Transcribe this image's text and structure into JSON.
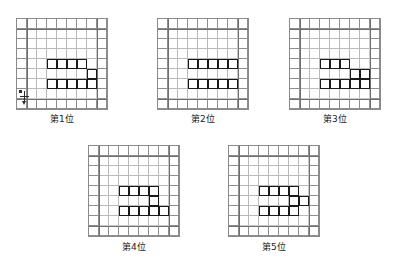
{
  "page": {
    "background": "#ffffff",
    "grid_line_color": "#b9b9b9",
    "grid_border_color": "#8a8a8a",
    "piece_color": "#1a1a1a",
    "caption_color": "#1a1a1a"
  },
  "grid": {
    "columns": 9,
    "rows": 9,
    "cell_px": 10
  },
  "figures": [
    {
      "id": "figure-1",
      "caption": "第1位",
      "piece_cells": [
        [
          4,
          3
        ],
        [
          4,
          4
        ],
        [
          4,
          5
        ],
        [
          4,
          6
        ],
        [
          5,
          7
        ],
        [
          6,
          3
        ],
        [
          6,
          4
        ],
        [
          6,
          5
        ],
        [
          6,
          6
        ],
        [
          6,
          7
        ]
      ],
      "has_marker": true
    },
    {
      "id": "figure-2",
      "caption": "第2位",
      "piece_cells": [
        [
          4,
          3
        ],
        [
          4,
          4
        ],
        [
          4,
          5
        ],
        [
          4,
          6
        ],
        [
          4,
          7
        ],
        [
          6,
          3
        ],
        [
          6,
          4
        ],
        [
          6,
          5
        ],
        [
          6,
          6
        ],
        [
          6,
          7
        ]
      ],
      "has_marker": false
    },
    {
      "id": "figure-3",
      "caption": "第3位",
      "piece_cells": [
        [
          4,
          3
        ],
        [
          4,
          4
        ],
        [
          4,
          5
        ],
        [
          5,
          6
        ],
        [
          5,
          7
        ],
        [
          6,
          3
        ],
        [
          6,
          4
        ],
        [
          6,
          5
        ],
        [
          6,
          6
        ],
        [
          6,
          7
        ]
      ],
      "has_marker": false
    },
    {
      "id": "figure-4",
      "caption": "第4位",
      "piece_cells": [
        [
          4,
          3
        ],
        [
          4,
          4
        ],
        [
          4,
          5
        ],
        [
          4,
          6
        ],
        [
          5,
          6
        ],
        [
          6,
          3
        ],
        [
          6,
          4
        ],
        [
          6,
          5
        ],
        [
          6,
          6
        ],
        [
          6,
          7
        ]
      ],
      "has_marker": false
    },
    {
      "id": "figure-5",
      "caption": "第5位",
      "piece_cells": [
        [
          4,
          3
        ],
        [
          4,
          4
        ],
        [
          4,
          5
        ],
        [
          4,
          6
        ],
        [
          5,
          6
        ],
        [
          5,
          7
        ],
        [
          6,
          3
        ],
        [
          6,
          4
        ],
        [
          6,
          5
        ],
        [
          6,
          6
        ]
      ],
      "has_marker": false
    }
  ],
  "layout": {
    "figure_positions": [
      {
        "left": 16,
        "top": 18
      },
      {
        "left": 157,
        "top": 18
      },
      {
        "left": 289,
        "top": 18
      },
      {
        "left": 88,
        "top": 145
      },
      {
        "left": 228,
        "top": 145
      }
    ],
    "caption_tops": [
      112,
      112,
      112,
      240,
      240
    ]
  }
}
